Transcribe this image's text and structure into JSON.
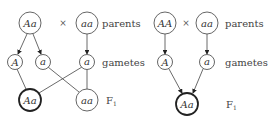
{
  "diagrams": [
    {
      "id": "left",
      "parents": [
        "Aa",
        "aa"
      ],
      "cross_symbol": "×",
      "gametes": [
        "A",
        "a",
        "a"
      ],
      "offspring": [
        "Aa",
        "aa"
      ],
      "row_labels": {
        "parents": "parents",
        "gametes": "gametes",
        "f1": "F",
        "f1_sub": "1"
      }
    },
    {
      "id": "right",
      "parents": [
        "AA",
        "aa"
      ],
      "cross_symbol": "×",
      "gametes": [
        "A",
        "a"
      ],
      "offspring": [
        "Aa"
      ],
      "row_labels": {
        "parents": "parents",
        "gametes": "gametes",
        "f1": "F",
        "f1_sub": "1"
      }
    }
  ],
  "colors": {
    "stroke": "#555555",
    "highlight_stroke": "#222222",
    "text": "#333333"
  }
}
